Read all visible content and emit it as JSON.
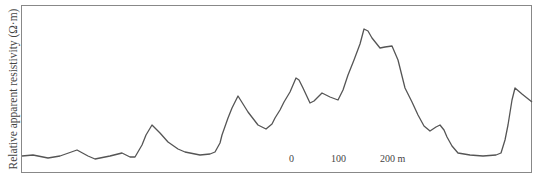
{
  "chart_data": {
    "type": "line",
    "title": "",
    "xlabel": "",
    "ylabel": "Relative apparent resistivity (Ω·m)",
    "grid": false,
    "legend": null,
    "scale_bar": {
      "labels": [
        "0",
        "100",
        "200 m"
      ]
    },
    "series": [
      {
        "name": "apparent resistivity profile",
        "points_px": [
          [
            22,
            156
          ],
          [
            33,
            155
          ],
          [
            48,
            158
          ],
          [
            60,
            156
          ],
          [
            77,
            150
          ],
          [
            88,
            156
          ],
          [
            95,
            159
          ],
          [
            110,
            156
          ],
          [
            122,
            153
          ],
          [
            130,
            157
          ],
          [
            135,
            157
          ],
          [
            142,
            145
          ],
          [
            146,
            135
          ],
          [
            152,
            125
          ],
          [
            160,
            133
          ],
          [
            168,
            142
          ],
          [
            178,
            149
          ],
          [
            185,
            152
          ],
          [
            200,
            155
          ],
          [
            210,
            154
          ],
          [
            215,
            152
          ],
          [
            220,
            143
          ],
          [
            222,
            135
          ],
          [
            228,
            118
          ],
          [
            232,
            108
          ],
          [
            238,
            96
          ],
          [
            243,
            104
          ],
          [
            248,
            112
          ],
          [
            258,
            125
          ],
          [
            266,
            129
          ],
          [
            272,
            124
          ],
          [
            275,
            118
          ],
          [
            280,
            110
          ],
          [
            284,
            102
          ],
          [
            290,
            92
          ],
          [
            293,
            85
          ],
          [
            296,
            78
          ],
          [
            299,
            80
          ],
          [
            303,
            88
          ],
          [
            310,
            103
          ],
          [
            314,
            101
          ],
          [
            318,
            97
          ],
          [
            322,
            93
          ],
          [
            330,
            97
          ],
          [
            338,
            100
          ],
          [
            343,
            90
          ],
          [
            348,
            75
          ],
          [
            354,
            60
          ],
          [
            360,
            44
          ],
          [
            364,
            29
          ],
          [
            368,
            31
          ],
          [
            372,
            38
          ],
          [
            380,
            48
          ],
          [
            385,
            47
          ],
          [
            392,
            46
          ],
          [
            398,
            60
          ],
          [
            405,
            88
          ],
          [
            412,
            102
          ],
          [
            418,
            115
          ],
          [
            424,
            126
          ],
          [
            430,
            131
          ],
          [
            436,
            127
          ],
          [
            440,
            125
          ],
          [
            444,
            130
          ],
          [
            447,
            137
          ],
          [
            452,
            146
          ],
          [
            458,
            153
          ],
          [
            470,
            155
          ],
          [
            483,
            156
          ],
          [
            496,
            155
          ],
          [
            501,
            153
          ],
          [
            505,
            140
          ],
          [
            508,
            125
          ],
          [
            512,
            100
          ],
          [
            515,
            88
          ],
          [
            522,
            94
          ],
          [
            532,
            102
          ]
        ]
      }
    ],
    "axes_frame_px": {
      "left": 21,
      "top": 5,
      "right": 532,
      "bottom": 173
    }
  }
}
